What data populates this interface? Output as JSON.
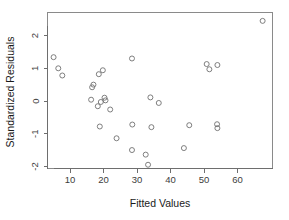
{
  "chart_data": {
    "type": "scatter",
    "title": "",
    "xlabel": "Fitted Values",
    "ylabel": "Standardized Residuals",
    "xlim": [
      3.5,
      70.5
    ],
    "ylim": [
      -2.35,
      2.65
    ],
    "xticks": [
      10,
      20,
      30,
      40,
      50,
      60
    ],
    "xticklabels": [
      "10",
      "20",
      "30",
      "40",
      "50",
      "60"
    ],
    "yticks": [
      -2,
      -1,
      0,
      1,
      2
    ],
    "yticklabels": [
      "-2",
      "-1",
      "0",
      "1",
      "2"
    ],
    "grid": false,
    "legend": null,
    "marker": "open-circle",
    "marker_color": "#707070",
    "frame_color": "#8a8a8a",
    "points": [
      {
        "x": 5.1,
        "y": 1.34
      },
      {
        "x": 6.5,
        "y": 1.0
      },
      {
        "x": 7.7,
        "y": 0.78
      },
      {
        "x": 16.6,
        "y": 0.42
      },
      {
        "x": 17.0,
        "y": 0.5
      },
      {
        "x": 16.3,
        "y": 0.04
      },
      {
        "x": 18.6,
        "y": 0.82
      },
      {
        "x": 19.8,
        "y": 0.94
      },
      {
        "x": 18.3,
        "y": -0.16
      },
      {
        "x": 19.2,
        "y": -0.03
      },
      {
        "x": 20.3,
        "y": 0.1
      },
      {
        "x": 20.6,
        "y": 0.02
      },
      {
        "x": 18.9,
        "y": -0.78
      },
      {
        "x": 22.0,
        "y": -0.26
      },
      {
        "x": 23.9,
        "y": -1.14
      },
      {
        "x": 28.5,
        "y": 1.3
      },
      {
        "x": 28.6,
        "y": -0.72
      },
      {
        "x": 28.5,
        "y": -1.5
      },
      {
        "x": 32.6,
        "y": -1.64
      },
      {
        "x": 33.3,
        "y": -1.95
      },
      {
        "x": 34.0,
        "y": 0.11
      },
      {
        "x": 34.3,
        "y": -0.8
      },
      {
        "x": 36.5,
        "y": -0.06
      },
      {
        "x": 44.0,
        "y": -1.44
      },
      {
        "x": 45.6,
        "y": -0.74
      },
      {
        "x": 50.8,
        "y": 1.13
      },
      {
        "x": 51.6,
        "y": 0.97
      },
      {
        "x": 54.0,
        "y": 1.1
      },
      {
        "x": 53.9,
        "y": -0.71
      },
      {
        "x": 54.0,
        "y": -0.83
      },
      {
        "x": 67.5,
        "y": 2.45
      }
    ]
  },
  "axes": {
    "x_title": "Fitted Values",
    "y_title": "Standardized Residuals"
  }
}
